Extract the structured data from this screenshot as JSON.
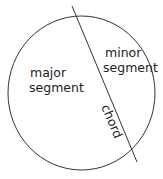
{
  "diagram": {
    "labels": {
      "major_line1": "major",
      "major_line2": "segment",
      "minor_line1": "minor",
      "minor_line2": "segment",
      "chord": "chord"
    },
    "colors": {
      "stroke": "#333333",
      "text": "#222222",
      "background": "#ffffff"
    }
  }
}
